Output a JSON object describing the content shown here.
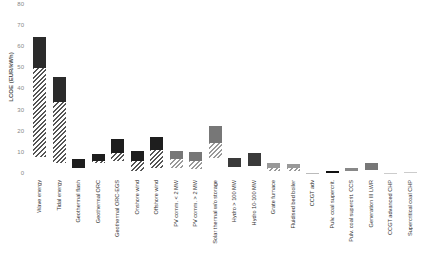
{
  "chart_data": {
    "type": "bar",
    "title": "",
    "xlabel": "",
    "ylabel": "LCOE (EUR/kWh)",
    "ylim": [
      0,
      80
    ],
    "yticks": [
      0,
      10,
      20,
      30,
      40,
      50,
      60,
      70,
      80
    ],
    "grid": false,
    "legend": null,
    "note": "Floating/stacked range bars: hatched segment = lower part of range, solid segment = upper part of range",
    "categories": [
      "Wave energy",
      "Tidal energy",
      "Geothermal flash",
      "Geothermal ORC",
      "Geothermal ORC-EGS",
      "Onshore wind",
      "Offshore wind",
      "PV comm. < 2 MW",
      "PV comm. > 2 MW",
      "Solar thermal w/o storage",
      "Hydro > 100 MW",
      "Hydro 10-100 MW",
      "Grate furnace",
      "Fluidised bed boiler",
      "CCGT adv",
      "Pulv. coal supercrit.",
      "Pulv. coal supercrit. CCS",
      "Generation III LWR",
      "CCGT advanced CHP",
      "Supercritical coal CHP"
    ],
    "series": [
      {
        "name": "range_min",
        "values": [
          8,
          5,
          3,
          5,
          6,
          1.5,
          3,
          3,
          2.5,
          7.5,
          3.5,
          4,
          1.5,
          1.5,
          0.2,
          0.5,
          1.5,
          2,
          0.1,
          0.8
        ]
      },
      {
        "name": "hatched_top",
        "values": [
          50,
          34,
          3,
          6,
          10,
          6,
          11.5,
          7,
          6,
          14.5,
          3.5,
          4,
          3,
          3,
          0.2,
          0.5,
          1.5,
          2,
          0.1,
          0.8
        ]
      },
      {
        "name": "range_max",
        "values": [
          65,
          46,
          7,
          9.5,
          16.5,
          11,
          17.5,
          11,
          10.5,
          22.5,
          7.5,
          10,
          5,
          4.5,
          0.4,
          1.5,
          3,
          5,
          0.3,
          1
        ]
      }
    ],
    "colors": [
      "#2b2b2b",
      "#2b2b2b",
      "#1e1e1e",
      "#1e1e1e",
      "#1e1e1e",
      "#1e1e1e",
      "#1e1e1e",
      "#777777",
      "#777777",
      "#777777",
      "#3a3a3a",
      "#3a3a3a",
      "#999999",
      "#999999",
      "#bbbbbb",
      "#111111",
      "#888888",
      "#777777",
      "#cccccc",
      "#cccccc"
    ]
  }
}
